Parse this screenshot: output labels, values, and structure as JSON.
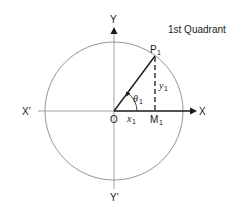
{
  "diagram": {
    "title": "1st Quadrant",
    "labels": {
      "y_axis_pos": "Y",
      "y_axis_neg": "Y'",
      "x_axis_pos": "X",
      "x_axis_neg": "X'",
      "origin": "O",
      "point": "P",
      "point_sub": "1",
      "foot": "M",
      "foot_sub": "1",
      "x_comp": "x",
      "x_comp_sub": "1",
      "y_comp": "y",
      "y_comp_sub": "1",
      "angle": "θ",
      "angle_sub": "1"
    },
    "colors": {
      "stroke": "#1a1a1a",
      "circle": "#6e6e6e",
      "axis": "#8a8a8a"
    }
  }
}
